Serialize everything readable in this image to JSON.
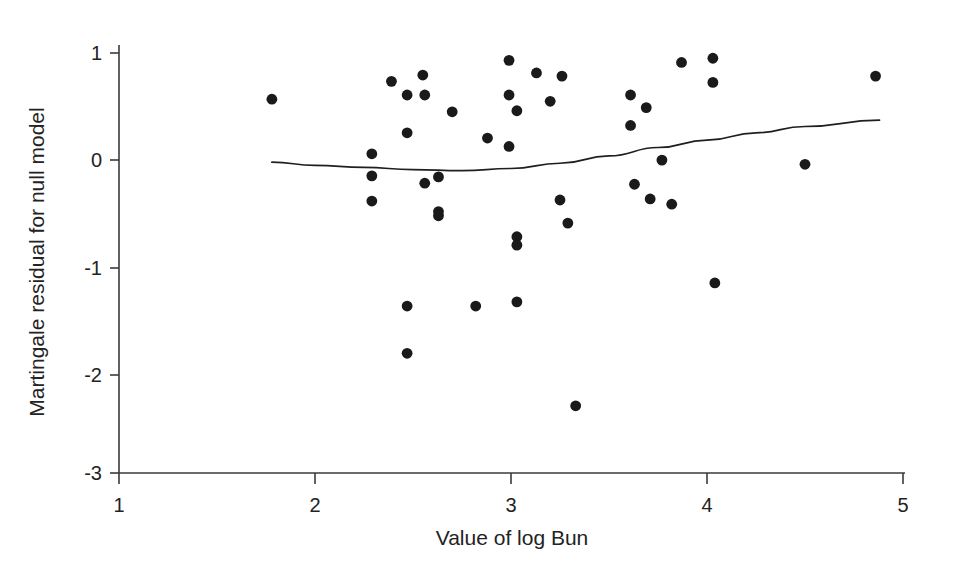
{
  "chart_data": {
    "type": "scatter",
    "title": "",
    "xlabel": "Value of log Bun",
    "ylabel": "Martingale residual for null model",
    "xlim": [
      1,
      5
    ],
    "ylim": [
      -3,
      1
    ],
    "xticks": [
      1,
      2,
      3,
      4,
      5
    ],
    "xtick_labels": [
      "1",
      "2",
      "3",
      "4",
      "5"
    ],
    "yticks": [
      1,
      0,
      -1,
      -2,
      -3
    ],
    "ytick_labels": [
      "1",
      "0",
      "-1",
      "-2",
      "-3"
    ],
    "grid": false,
    "legend": null,
    "marker_color": "#1a1a1a",
    "line_color": "#1f1f1f",
    "points": [
      {
        "x": 1.78,
        "y": 0.56
      },
      {
        "x": 2.29,
        "y": 0.04
      },
      {
        "x": 2.29,
        "y": -0.17
      },
      {
        "x": 2.29,
        "y": -0.41
      },
      {
        "x": 2.39,
        "y": 0.73
      },
      {
        "x": 2.47,
        "y": 0.6
      },
      {
        "x": 2.47,
        "y": 0.24
      },
      {
        "x": 2.47,
        "y": -1.41
      },
      {
        "x": 2.47,
        "y": -1.86
      },
      {
        "x": 2.55,
        "y": 0.79
      },
      {
        "x": 2.56,
        "y": 0.6
      },
      {
        "x": 2.56,
        "y": -0.24
      },
      {
        "x": 2.63,
        "y": -0.18
      },
      {
        "x": 2.63,
        "y": -0.51
      },
      {
        "x": 2.63,
        "y": -0.55
      },
      {
        "x": 2.7,
        "y": 0.44
      },
      {
        "x": 2.82,
        "y": -1.41
      },
      {
        "x": 2.88,
        "y": 0.19
      },
      {
        "x": 2.99,
        "y": 0.93
      },
      {
        "x": 2.99,
        "y": 0.6
      },
      {
        "x": 2.99,
        "y": 0.11
      },
      {
        "x": 3.03,
        "y": 0.45
      },
      {
        "x": 3.03,
        "y": -0.75
      },
      {
        "x": 3.03,
        "y": -0.83
      },
      {
        "x": 3.03,
        "y": -1.37
      },
      {
        "x": 3.13,
        "y": 0.81
      },
      {
        "x": 3.2,
        "y": 0.54
      },
      {
        "x": 3.25,
        "y": -0.4
      },
      {
        "x": 3.26,
        "y": 0.78
      },
      {
        "x": 3.29,
        "y": -0.62
      },
      {
        "x": 3.33,
        "y": -2.36
      },
      {
        "x": 3.61,
        "y": 0.6
      },
      {
        "x": 3.61,
        "y": 0.31
      },
      {
        "x": 3.63,
        "y": -0.25
      },
      {
        "x": 3.69,
        "y": 0.48
      },
      {
        "x": 3.71,
        "y": -0.39
      },
      {
        "x": 3.77,
        "y": -0.02
      },
      {
        "x": 3.82,
        "y": -0.44
      },
      {
        "x": 3.87,
        "y": 0.91
      },
      {
        "x": 4.03,
        "y": 0.72
      },
      {
        "x": 4.03,
        "y": 0.95
      },
      {
        "x": 4.04,
        "y": -1.19
      },
      {
        "x": 4.5,
        "y": -0.06
      },
      {
        "x": 4.86,
        "y": 0.78
      }
    ],
    "smoother_line": {
      "description": "lowess smoothed trend",
      "points": [
        {
          "x": 1.78,
          "y": -0.04
        },
        {
          "x": 2.0,
          "y": -0.07
        },
        {
          "x": 2.25,
          "y": -0.09
        },
        {
          "x": 2.5,
          "y": -0.11
        },
        {
          "x": 2.75,
          "y": -0.12
        },
        {
          "x": 3.0,
          "y": -0.1
        },
        {
          "x": 3.25,
          "y": -0.05
        },
        {
          "x": 3.5,
          "y": 0.02
        },
        {
          "x": 3.75,
          "y": 0.1
        },
        {
          "x": 4.0,
          "y": 0.17
        },
        {
          "x": 4.25,
          "y": 0.24
        },
        {
          "x": 4.5,
          "y": 0.3
        },
        {
          "x": 4.88,
          "y": 0.36
        }
      ]
    }
  }
}
